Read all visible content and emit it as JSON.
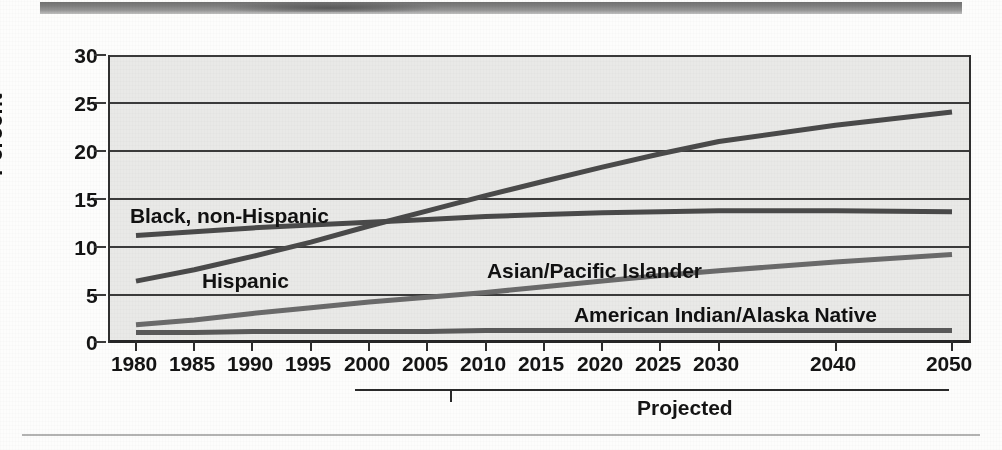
{
  "chart_data": {
    "type": "line",
    "title": "",
    "xlabel": "",
    "ylabel": "Percent",
    "ylim": [
      0,
      30
    ],
    "xlim": [
      1980,
      2050
    ],
    "grid": true,
    "legend_position": "inline-labels",
    "yticks": [
      0,
      5,
      10,
      15,
      20,
      25,
      30
    ],
    "ytick_labels": [
      "0",
      "5",
      "10",
      "15",
      "20",
      "25",
      "30"
    ],
    "xticks": [
      1980,
      1985,
      1990,
      1995,
      2000,
      2005,
      2010,
      2015,
      2020,
      2025,
      2030,
      2040,
      2050
    ],
    "xtick_labels": [
      "1980",
      "1985",
      "1990",
      "1995",
      "2000",
      "2005",
      "2010",
      "2015",
      "2020",
      "2025",
      "2030",
      "2040",
      "2050"
    ],
    "annotation": "Projected",
    "projection_start_year": 2000,
    "series": [
      {
        "name": "Hispanic",
        "color": "#4a4a4a",
        "x": [
          1980,
          1985,
          1990,
          1995,
          2000,
          2005,
          2010,
          2015,
          2020,
          2025,
          2030,
          2040,
          2050
        ],
        "values": [
          6.2,
          7.4,
          8.8,
          10.3,
          12.0,
          13.6,
          15.2,
          16.7,
          18.2,
          19.6,
          20.9,
          22.6,
          24.0
        ]
      },
      {
        "name": "Black, non-Hispanic",
        "color": "#4a4a4a",
        "x": [
          1980,
          1985,
          1990,
          1995,
          2000,
          2005,
          2010,
          2015,
          2020,
          2025,
          2030,
          2040,
          2050
        ],
        "values": [
          11.0,
          11.4,
          11.8,
          12.1,
          12.4,
          12.7,
          13.0,
          13.2,
          13.4,
          13.5,
          13.6,
          13.6,
          13.5
        ]
      },
      {
        "name": "Asian/Pacific Islander",
        "color": "#6a6a6a",
        "x": [
          1980,
          1985,
          1990,
          1995,
          2000,
          2005,
          2010,
          2015,
          2020,
          2025,
          2030,
          2040,
          2050
        ],
        "values": [
          1.6,
          2.1,
          2.8,
          3.4,
          4.0,
          4.5,
          5.0,
          5.6,
          6.2,
          6.8,
          7.3,
          8.2,
          9.0
        ]
      },
      {
        "name": "American Indian/Alaska Native",
        "color": "#5a5a5a",
        "x": [
          1980,
          1985,
          1990,
          1995,
          2000,
          2005,
          2010,
          2015,
          2020,
          2025,
          2030,
          2040,
          2050
        ],
        "values": [
          0.8,
          0.8,
          0.9,
          0.9,
          0.9,
          0.9,
          1.0,
          1.0,
          1.0,
          1.0,
          1.0,
          1.0,
          1.0
        ]
      }
    ]
  },
  "axis": {
    "y_title": "Percent",
    "ticks_y": [
      "30",
      "25",
      "20",
      "15",
      "10",
      "5",
      "0"
    ],
    "ticks_x": [
      "1980",
      "1985",
      "1990",
      "1995",
      "2000",
      "2005",
      "2010",
      "2015",
      "2020",
      "2025",
      "2030",
      "2040",
      "2050"
    ]
  },
  "labels": {
    "black_non_hispanic": "Black, non-Hispanic",
    "hispanic": "Hispanic",
    "asian_pacific_islander": "Asian/Pacific Islander",
    "american_indian_alaska_native": "American Indian/Alaska Native",
    "projected": "Projected"
  },
  "colors": {
    "plot_background": "#e9e9e7",
    "gridline": "#3a3a3a",
    "axis": "#262626",
    "series_dark": "#4a4a4a",
    "series_mid": "#5a5a5a",
    "series_light": "#6a6a6a",
    "text": "#141414"
  }
}
